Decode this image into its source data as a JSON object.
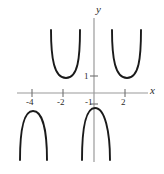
{
  "figure": {
    "name": "secant-style-periodic-function-graph",
    "background_color": "#ffffff",
    "width": 164,
    "height": 174
  },
  "axes": {
    "x_label": "x",
    "y_label": "y",
    "axis_color": "#9a9a9a",
    "x_axis_pixel_y": 93,
    "y_axis_pixel_x": 94,
    "x_axis_pixel_start": 17,
    "x_axis_pixel_end": 148,
    "y_axis_pixel_start": 18,
    "y_axis_pixel_end": 162,
    "x_ticks": [
      {
        "label": "-4",
        "value": -4,
        "pixel_x": 32
      },
      {
        "label": "-2",
        "value": -2,
        "pixel_x": 63
      },
      {
        "label": "2",
        "value": 2,
        "pixel_x": 125
      }
    ],
    "y_ticks": [
      {
        "label": "1",
        "value": 1,
        "pixel_y": 76
      },
      {
        "label": "-1",
        "value": -1,
        "pixel_y": 104
      }
    ]
  },
  "chart_data": {
    "type": "line",
    "title": "",
    "xlabel": "x",
    "ylabel": "y",
    "grid": false,
    "legend": false,
    "xlim": [
      -5.3,
      3.5
    ],
    "ylim": [
      -4.3,
      4.0
    ],
    "xticks": [
      -4,
      -2,
      2
    ],
    "yticks": [
      1,
      -1
    ],
    "curve_color": "#1a1a1a",
    "curve_width": 1.9,
    "series": [
      {
        "name": "branch-upper-left",
        "orientation": "up",
        "vertex": {
          "x": -2.6,
          "y": 1
        },
        "path_pixels": "M 51,30 C 51,58 54,78 66,78 C 78,78 80,58 80,30"
      },
      {
        "name": "branch-upper-right",
        "orientation": "up",
        "vertex": {
          "x": 1.3,
          "y": 1
        },
        "path_pixels": "M 112,30 C 112,58 115,78 127,78 C 139,78 141,58 141,30"
      },
      {
        "name": "branch-lower-left",
        "orientation": "down",
        "vertex": {
          "x": -4.2,
          "y": -1
        },
        "path_pixels": "M 20,160 C 20,132 23,111 33,111 C 43,111 47,132 47,160"
      },
      {
        "name": "branch-lower-right",
        "orientation": "down",
        "vertex": {
          "x": -0.2,
          "y": -1
        },
        "path_pixels": "M 82,160 C 82,132 85,108 95,108 C 105,108 110,132 110,160"
      }
    ]
  }
}
